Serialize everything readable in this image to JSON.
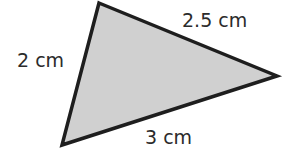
{
  "figure": {
    "shape": "triangle",
    "fill_color": "#d0d0d0",
    "stroke_color": "#1e1e1e",
    "vertices": [
      [
        99,
        3
      ],
      [
        277,
        76
      ],
      [
        62,
        145
      ]
    ],
    "sides": {
      "left": {
        "label": "2 cm",
        "length_cm": 2
      },
      "top_right": {
        "label": "2.5 cm",
        "length_cm": 2.5
      },
      "bottom": {
        "label": "3 cm",
        "length_cm": 3
      }
    }
  }
}
